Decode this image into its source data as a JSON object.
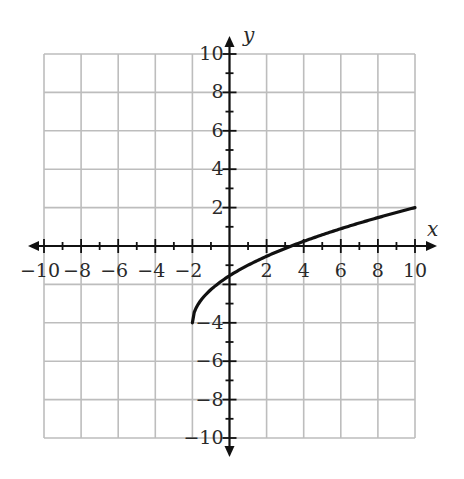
{
  "chart_data": {
    "type": "line",
    "title": "",
    "xlabel": "x",
    "ylabel": "y",
    "xlim": [
      -10,
      10
    ],
    "ylim": [
      -10,
      10
    ],
    "grid": true,
    "grid_step": 2,
    "minor_tick_step": 1,
    "x_tick_labels": [
      "-10",
      "-8",
      "-6",
      "-4",
      "-2",
      "2",
      "4",
      "6",
      "8",
      "10"
    ],
    "y_tick_labels": [
      "10",
      "8",
      "6",
      "4",
      "2",
      "-4",
      "-6",
      "-8",
      "-10"
    ],
    "series": [
      {
        "name": "f(x)",
        "function_estimate": "y = sqrt(3(x+2)) - 4",
        "domain": [
          -2,
          10
        ],
        "points": [
          {
            "x": -2,
            "y": -4
          },
          {
            "x": -1,
            "y": -2.27
          },
          {
            "x": 0,
            "y": -1.55
          },
          {
            "x": 2,
            "y": -0.54
          },
          {
            "x": 3.33,
            "y": 0
          },
          {
            "x": 4,
            "y": 0.24
          },
          {
            "x": 6,
            "y": 0.9
          },
          {
            "x": 8,
            "y": 1.48
          },
          {
            "x": 10,
            "y": 2
          }
        ],
        "color": "#111111"
      }
    ],
    "colors": {
      "grid": "#bdbdbd",
      "axis": "#111111",
      "curve": "#111111",
      "label": "#2a2a2a"
    }
  }
}
